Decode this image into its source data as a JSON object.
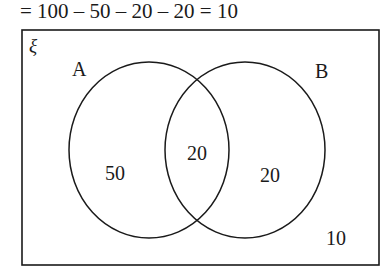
{
  "equation": "= 100 – 50 – 20 – 20 = 10",
  "venn": {
    "universal_symbol": "ξ",
    "sets": [
      {
        "label": "A",
        "only_value": "50"
      },
      {
        "label": "B",
        "only_value": "20"
      }
    ],
    "intersection_value": "20",
    "outside_value": "10"
  },
  "colors": {
    "line": "#1a1a1a",
    "background": "#ffffff"
  }
}
